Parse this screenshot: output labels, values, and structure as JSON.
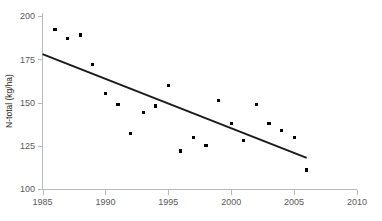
{
  "chart_data": {
    "type": "scatter",
    "title": "",
    "xlabel": "",
    "ylabel": "N-total (kg/ha)",
    "xlim": [
      1985,
      2010
    ],
    "ylim": [
      100,
      200
    ],
    "grid": false,
    "legend": "none",
    "x_ticks": [
      1985,
      1990,
      1995,
      2000,
      2005,
      2010
    ],
    "y_ticks": [
      100,
      125,
      150,
      175,
      200
    ],
    "x_tick_labels": [
      "1985",
      "1990",
      "1995",
      "2000",
      "2005",
      "2010"
    ],
    "y_tick_labels": [
      "100",
      "125",
      "150",
      "175",
      "200"
    ],
    "series": [
      {
        "name": "N-total",
        "marker": "square",
        "color": "#000000",
        "x": [
          1986,
          1987,
          1988,
          1989,
          1990,
          1991,
          1992,
          1993,
          1994,
          1995,
          1996,
          1997,
          1998,
          1999,
          2000,
          2001,
          2002,
          2003,
          2004,
          2005,
          2006
        ],
        "values": [
          192,
          187,
          189,
          172,
          155,
          149,
          132,
          144,
          148,
          160,
          122,
          130,
          125,
          151,
          138,
          128,
          149,
          138,
          134,
          130,
          111
        ]
      },
      {
        "name": "Linear trend",
        "marker": "none",
        "color": "#1a1a1a",
        "type": "line",
        "x": [
          1985,
          2006
        ],
        "values": [
          178,
          118
        ]
      }
    ]
  },
  "axis": {
    "y_label": "N-total (kg/ha)",
    "x_label": ""
  }
}
